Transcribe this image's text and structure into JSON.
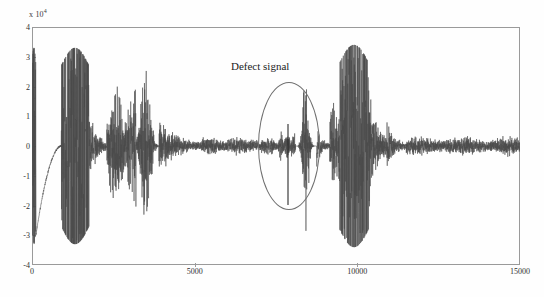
{
  "figure": {
    "title": "",
    "background_color": "#fefefe",
    "frame_color": "#9a9a9a",
    "signal_color": "#4a4a4a"
  },
  "axes": {
    "exponent_prefix": "x 10",
    "exponent_power": "4",
    "y_ticks": [
      "4",
      "3",
      "2",
      "1",
      "0",
      "-1",
      "-2",
      "-3",
      "-4"
    ],
    "x_ticks": [
      "0",
      "5000",
      "10000",
      "15000"
    ]
  },
  "annotation": {
    "defect_label": "Defect signal",
    "ellipse_name": "defect-region-ellipse"
  },
  "chart_data": {
    "type": "line",
    "title": "",
    "xlabel": "",
    "ylabel": "",
    "xlim": [
      0,
      15000
    ],
    "ylim": [
      -40000,
      40000
    ],
    "y_scale_exponent": 4,
    "grid": false,
    "legend": null,
    "x_tick_values": [
      0,
      5000,
      10000,
      15000
    ],
    "y_tick_values": [
      40000,
      30000,
      20000,
      10000,
      0,
      -10000,
      -20000,
      -30000,
      -40000
    ],
    "series": [
      {
        "name": "vibration signal",
        "description": "Full-length raw vibration / acoustic-emission waveform with several high-amplitude burst packets and a smaller defect burst highlighted near x=8400.",
        "envelope_segments": [
          {
            "x_start": 0,
            "x_end": 120,
            "amplitude": 33000,
            "style": "saturated-burst"
          },
          {
            "x_start": 120,
            "x_end": 900,
            "amplitude": 1500,
            "style": "rising-ramp",
            "note": "curve rising from about -30000 up to 0"
          },
          {
            "x_start": 900,
            "x_end": 1750,
            "amplitude": 33000,
            "style": "saturated-burst"
          },
          {
            "x_start": 1750,
            "x_end": 2300,
            "amplitude": 9000,
            "style": "decay"
          },
          {
            "x_start": 2300,
            "x_end": 3200,
            "amplitude": 14000,
            "style": "modulated"
          },
          {
            "x_start": 3200,
            "x_end": 3900,
            "amplitude": 21000,
            "style": "burst-peak"
          },
          {
            "x_start": 3900,
            "x_end": 5200,
            "amplitude": 7000,
            "style": "decay"
          },
          {
            "x_start": 5200,
            "x_end": 7600,
            "amplitude": 2200,
            "style": "low-noise"
          },
          {
            "x_start": 7600,
            "x_end": 8100,
            "amplitude": 3500,
            "style": "low-noise"
          },
          {
            "x_start": 8100,
            "x_end": 8750,
            "amplitude": 19000,
            "style": "defect-burst"
          },
          {
            "x_start": 8750,
            "x_end": 9150,
            "amplitude": 5000,
            "style": "decay"
          },
          {
            "x_start": 9150,
            "x_end": 9450,
            "amplitude": 11000,
            "style": "modulated"
          },
          {
            "x_start": 9450,
            "x_end": 10350,
            "amplitude": 34000,
            "style": "saturated-burst"
          },
          {
            "x_start": 10350,
            "x_end": 10900,
            "amplitude": 17000,
            "style": "decay"
          },
          {
            "x_start": 10900,
            "x_end": 11500,
            "amplitude": 6000,
            "style": "decay"
          },
          {
            "x_start": 11500,
            "x_end": 15000,
            "amplitude": 2300,
            "style": "low-noise"
          }
        ],
        "marked_events": [
          {
            "label": "Defect signal",
            "x_center": 8400,
            "peak_amplitude": 19000
          }
        ]
      }
    ]
  }
}
